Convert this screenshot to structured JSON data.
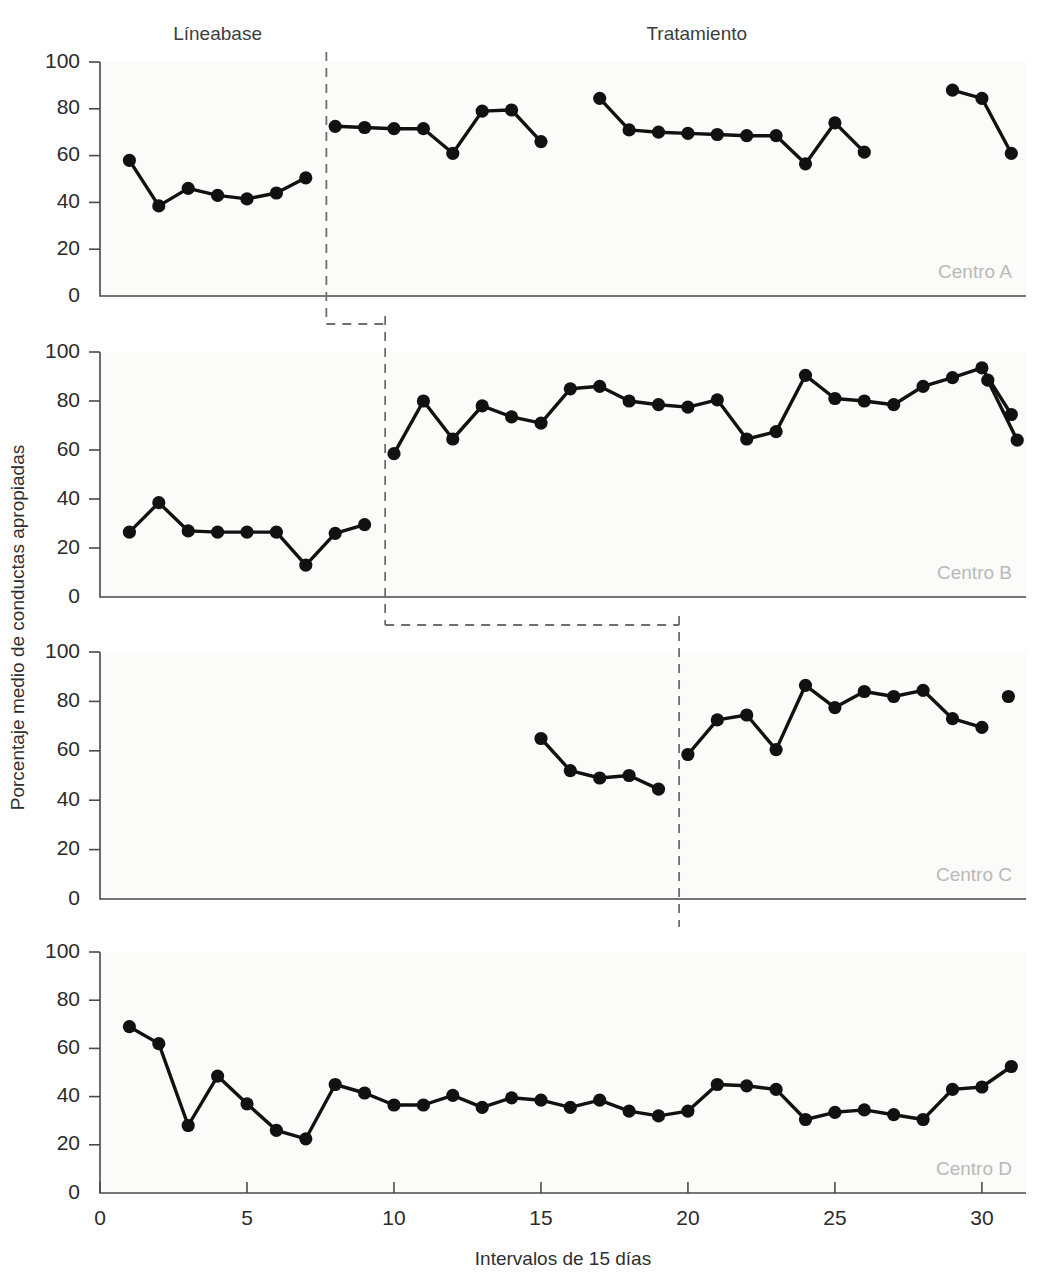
{
  "chart_data": {
    "type": "line",
    "title": "",
    "xlabel": "Intervalos de 15 días",
    "ylabel": "Porcentaje medio de conductas apropiadas",
    "xlim": [
      0,
      31.5
    ],
    "ylim": [
      0,
      100
    ],
    "xticks": [
      0,
      5,
      10,
      15,
      20,
      25,
      30
    ],
    "yticks": [
      0,
      20,
      40,
      60,
      80,
      100
    ],
    "grid": false,
    "legend": "none",
    "phase_labels": [
      {
        "text": "Líneabase",
        "x": 4.0
      },
      {
        "text": "Tratamiento",
        "x": 20.3
      }
    ],
    "panels": [
      {
        "name": "Centro A",
        "phase_change_x": 7.7,
        "series": [
          {
            "name": "Líneabase",
            "x": [
              1,
              2,
              3,
              4,
              5,
              6,
              7
            ],
            "values": [
              58,
              38.5,
              46,
              43,
              41.5,
              44,
              50.5
            ]
          },
          {
            "name": "Tratamiento",
            "x": [
              8,
              9,
              10,
              11,
              12,
              13,
              14,
              15
            ],
            "values": [
              72.5,
              72,
              71.5,
              71.5,
              61,
              79,
              79.5,
              66
            ]
          },
          {
            "name": "Tratamiento",
            "x": [
              17,
              18,
              19,
              20,
              21,
              22,
              23,
              24,
              25,
              26
            ],
            "values": [
              84.5,
              71,
              70,
              69.5,
              69,
              68.5,
              68.5,
              56.5,
              74,
              61.5
            ]
          },
          {
            "name": "Tratamiento",
            "x": [
              29,
              30,
              31
            ],
            "values": [
              88,
              84.5,
              61
            ]
          }
        ]
      },
      {
        "name": "Centro B",
        "phase_change_x": 9.7,
        "series": [
          {
            "name": "Líneabase",
            "x": [
              1,
              2,
              3,
              4,
              5,
              6,
              7,
              8,
              9
            ],
            "values": [
              26.5,
              38.5,
              27,
              26.5,
              26.5,
              26.5,
              13,
              26,
              29.5
            ]
          },
          {
            "name": "Tratamiento",
            "x": [
              10,
              11,
              12,
              13,
              14,
              15,
              16,
              17,
              18,
              19,
              20,
              21,
              22,
              23,
              24,
              25,
              26,
              27,
              28,
              29,
              30,
              31
            ],
            "values": [
              58.5,
              80,
              64.5,
              78,
              73.5,
              71,
              85,
              86,
              80,
              78.5,
              77.5,
              80.5,
              64.5,
              67.5,
              90.5,
              81,
              80,
              78.5,
              86,
              89.5,
              93.5,
              74.5
            ]
          },
          {
            "name": "Tratamiento",
            "x": [
              30.2,
              31.2
            ],
            "values": [
              88.5,
              64
            ]
          }
        ]
      },
      {
        "name": "Centro C",
        "phase_change_x": 19.7,
        "series": [
          {
            "name": "Líneabase",
            "x": [
              15,
              16,
              17,
              18,
              19
            ],
            "values": [
              65,
              52,
              49,
              50,
              44.5
            ]
          },
          {
            "name": "Tratamiento",
            "x": [
              20,
              21,
              22,
              23,
              24,
              25,
              26,
              27,
              28,
              29,
              30
            ],
            "values": [
              58.5,
              72.5,
              74.5,
              60.5,
              86.5,
              77.5,
              84,
              82,
              84.5,
              73,
              69.5
            ]
          },
          {
            "name": "Tratamiento",
            "x": [
              30.9
            ],
            "values": [
              82
            ]
          }
        ]
      },
      {
        "name": "Centro D",
        "phase_change_x": null,
        "series": [
          {
            "name": "Líneabase",
            "x": [
              1,
              2,
              3,
              4,
              5,
              6,
              7,
              8,
              9,
              10,
              11,
              12,
              13,
              14,
              15,
              16,
              17,
              18,
              19,
              20,
              21,
              22,
              23,
              24,
              25,
              26,
              27,
              28,
              29,
              30,
              31
            ],
            "values": [
              69,
              62,
              28,
              48.5,
              37,
              26,
              22.5,
              45,
              41.5,
              36.5,
              36.5,
              40.5,
              35.5,
              39.5,
              38.5,
              35.5,
              38.5,
              34,
              32,
              34,
              45,
              44.5,
              43,
              30.5,
              33.5,
              34.5,
              32.5,
              30.5,
              43,
              44,
              52.5
            ]
          }
        ]
      }
    ],
    "stepwise_connectors": [
      {
        "from_panel": 0,
        "to_panel": 1,
        "from_x": 7.7,
        "to_x": 9.7
      },
      {
        "from_panel": 1,
        "to_panel": 2,
        "from_x": 9.7,
        "to_x": 19.7
      }
    ]
  }
}
